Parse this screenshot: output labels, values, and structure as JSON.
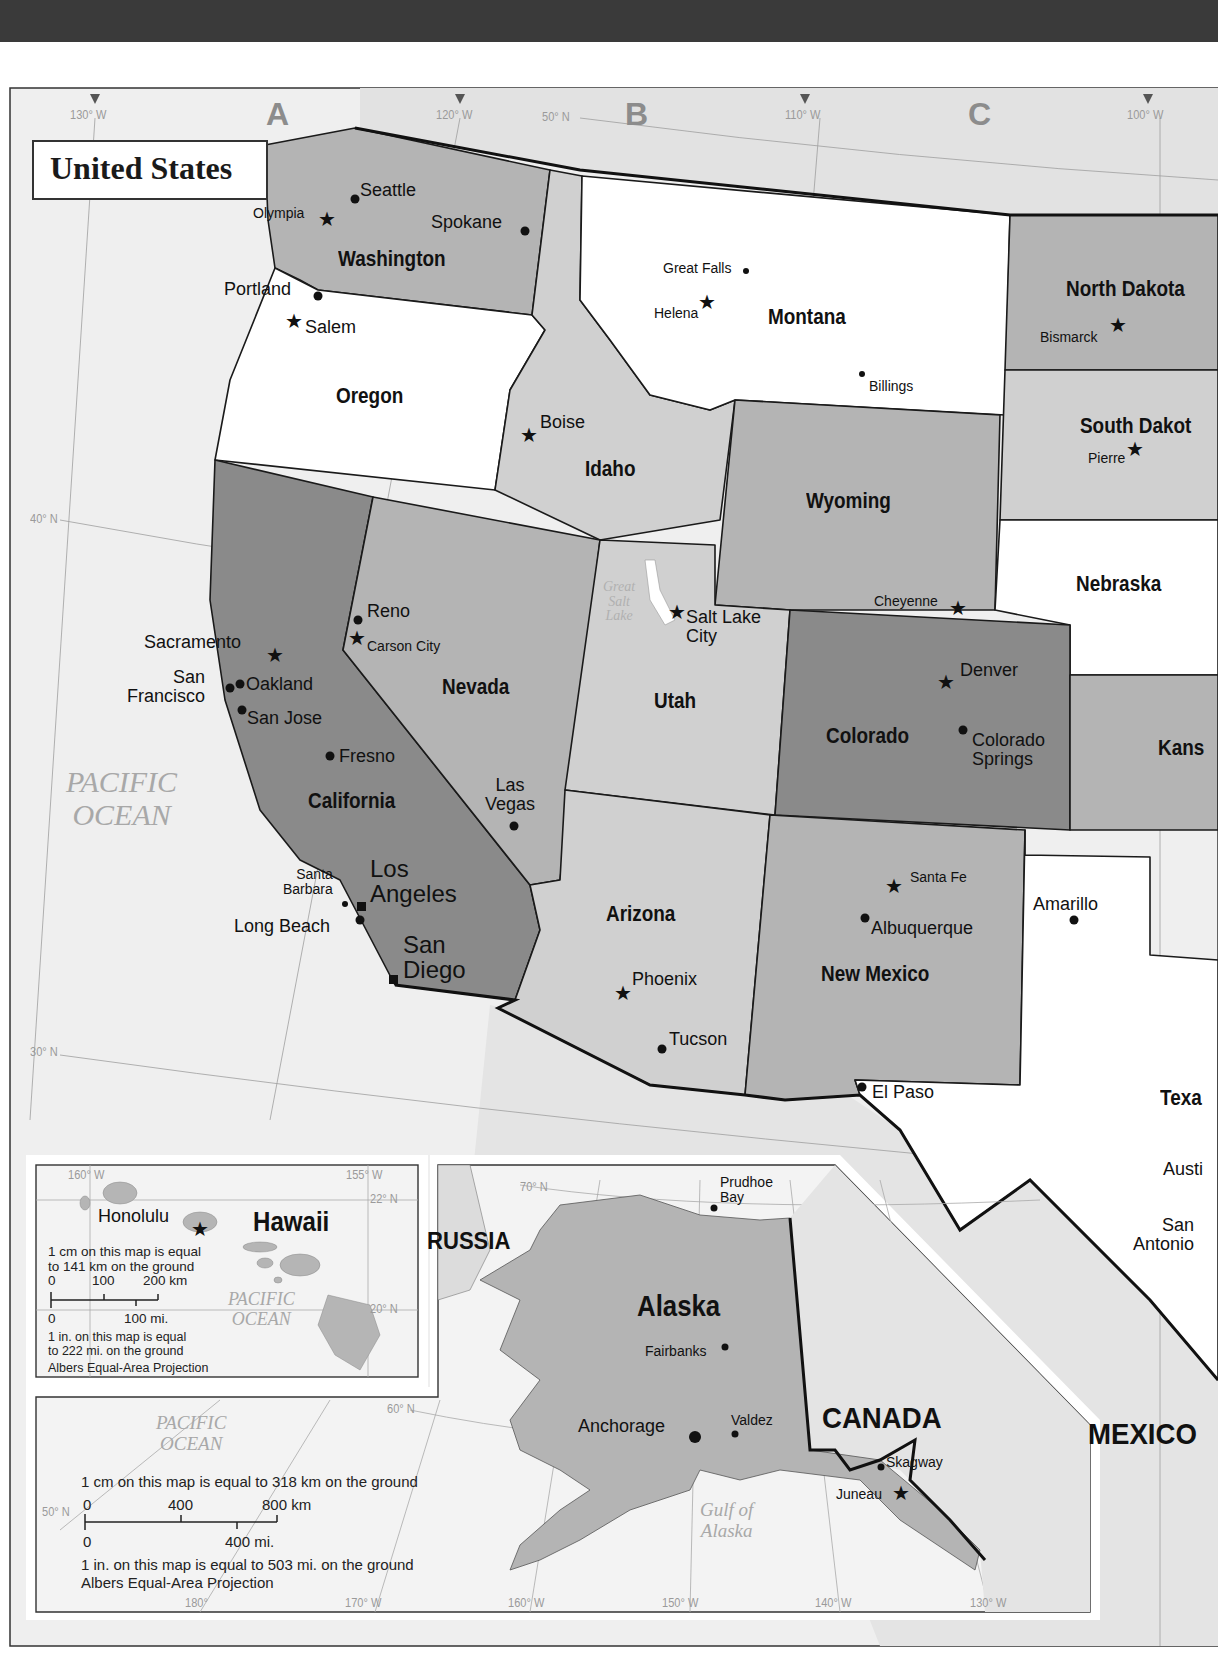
{
  "map": {
    "title": "United States",
    "colors": {
      "dark": "#8a8a8a",
      "medium": "#b4b4b4",
      "light": "#d0d0d0",
      "white": "#ffffff",
      "sea": "#efefef",
      "border": "#1a1a1a"
    },
    "graticule": {
      "top": [
        "130° W",
        "120° W",
        "50° N",
        "110° W",
        "100° W"
      ],
      "side": [
        "40° N",
        "30° N"
      ]
    },
    "grid_letters": [
      "A",
      "B",
      "C"
    ],
    "states": [
      {
        "name": "Washington",
        "shade": "medium"
      },
      {
        "name": "Oregon",
        "shade": "white"
      },
      {
        "name": "Idaho",
        "shade": "light"
      },
      {
        "name": "Montana",
        "shade": "white"
      },
      {
        "name": "North Dakota",
        "shade": "medium"
      },
      {
        "name": "South Dakot",
        "shade": "light"
      },
      {
        "name": "Wyoming",
        "shade": "medium"
      },
      {
        "name": "Nebraska",
        "shade": "white"
      },
      {
        "name": "California",
        "shade": "dark"
      },
      {
        "name": "Nevada",
        "shade": "medium"
      },
      {
        "name": "Utah",
        "shade": "light"
      },
      {
        "name": "Colorado",
        "shade": "dark"
      },
      {
        "name": "Kans",
        "shade": "medium"
      },
      {
        "name": "Arizona",
        "shade": "light"
      },
      {
        "name": "New Mexico",
        "shade": "medium"
      },
      {
        "name": "Texa",
        "shade": "white"
      }
    ],
    "cities": {
      "seattle": "Seattle",
      "olympia": "Olympia",
      "spokane": "Spokane",
      "portland": "Portland",
      "salem": "Salem",
      "great_falls": "Great Falls",
      "helena": "Helena",
      "billings": "Billings",
      "bismarck": "Bismarck",
      "pierre": "Pierre",
      "boise": "Boise",
      "cheyenne": "Cheyenne",
      "reno": "Reno",
      "carson_city": "Carson City",
      "sacramento": "Sacramento",
      "san_francisco": "San\nFrancisco",
      "oakland": "Oakland",
      "san_jose": "San Jose",
      "fresno": "Fresno",
      "salt_lake_city": "Salt Lake\nCity",
      "denver": "Denver",
      "colorado_springs": "Colorado\nSprings",
      "las_vegas": "Las\nVegas",
      "santa_barbara": "Santa\nBarbara",
      "los_angeles": "Los\nAngeles",
      "long_beach": "Long Beach",
      "san_diego": "San\nDiego",
      "phoenix": "Phoenix",
      "tucson": "Tucson",
      "santa_fe": "Santa Fe",
      "albuquerque": "Albuquerque",
      "amarillo": "Amarillo",
      "el_paso": "El Paso",
      "austin": "Austi",
      "san_antonio": "San\nAntonio"
    },
    "water": {
      "pacific": "PACIFIC\nOCEAN",
      "great_salt_lake": "Great\nSalt\nLake"
    },
    "countries": {
      "mexico": "MEXICO"
    }
  },
  "hawaii_inset": {
    "title": "Hawaii",
    "capital": "Honolulu",
    "graticule": [
      "160° W",
      "155° W",
      "22° N",
      "20° N"
    ],
    "ocean": "PACIFIC\nOCEAN",
    "scale_note_metric": "1 cm on this map is equal\nto 141 km on the ground",
    "scale_km": [
      "0",
      "100",
      "200 km"
    ],
    "scale_mi": [
      "0",
      "100 mi."
    ],
    "scale_note_imperial": "1 in. on this map is equal\nto 222 mi. on the ground",
    "projection": "Albers Equal-Area Projection"
  },
  "alaska_inset": {
    "title": "Alaska",
    "cities": {
      "prudhoe_bay": "Prudhoe\nBay",
      "fairbanks": "Fairbanks",
      "anchorage": "Anchorage",
      "valdez": "Valdez",
      "skagway": "Skagway",
      "juneau": "Juneau"
    },
    "countries": {
      "russia": "RUSSIA",
      "canada": "CANADA"
    },
    "water": {
      "pacific": "PACIFIC\nOCEAN",
      "gulf": "Gulf of\nAlaska"
    },
    "graticule": [
      "70° N",
      "60° N",
      "50° N",
      "180°",
      "170° W",
      "160° W",
      "150° W",
      "140° W",
      "130° W"
    ],
    "scale_note_metric": "1 cm on this map is equal to 318 km on the ground",
    "scale_km": [
      "0",
      "400",
      "800 km"
    ],
    "scale_mi": [
      "0",
      "400 mi."
    ],
    "scale_note_imperial": "1 in. on this map is equal to 503 mi. on the ground",
    "projection": "Albers Equal-Area Projection"
  }
}
